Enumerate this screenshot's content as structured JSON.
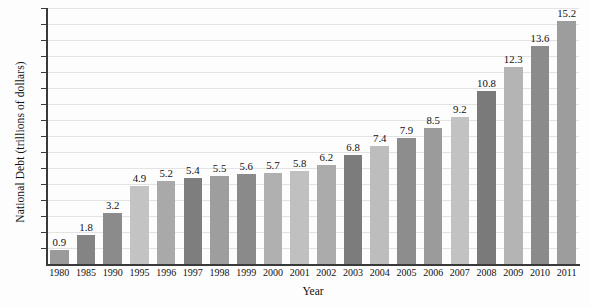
{
  "chart_data": {
    "type": "bar",
    "title": "",
    "xlabel": "Year",
    "ylabel": "National Debt (trillions of dollars)",
    "categories": [
      "1980",
      "1985",
      "1990",
      "1995",
      "1996",
      "1997",
      "1998",
      "1999",
      "2000",
      "2001",
      "2002",
      "2003",
      "2004",
      "2005",
      "2006",
      "2007",
      "2008",
      "2009",
      "2010",
      "2011"
    ],
    "values": [
      0.9,
      1.8,
      3.2,
      4.9,
      5.2,
      5.4,
      5.5,
      5.6,
      5.7,
      5.8,
      6.2,
      6.8,
      7.4,
      7.9,
      8.5,
      9.2,
      10.8,
      12.3,
      13.6,
      15.2
    ],
    "value_labels": [
      "0.9",
      "1.8",
      "3.2",
      "4.9",
      "5.2",
      "5.4",
      "5.5",
      "5.6",
      "5.7",
      "5.8",
      "6.2",
      "6.8",
      "7.4",
      "7.9",
      "8.5",
      "9.2",
      "10.8",
      "12.3",
      "13.6",
      "15.2"
    ],
    "bar_colors": [
      "#9a9a9a",
      "#848484",
      "#8b8b8b",
      "#c3c3c3",
      "#a9a9a9",
      "#7e7e7e",
      "#9e9e9e",
      "#8a8a8a",
      "#b0b0b0",
      "#c0c0c0",
      "#ababab",
      "#7c7c7c",
      "#bdbdbd",
      "#8d8d8d",
      "#9b9b9b",
      "#c2c2c2",
      "#7a7a7a",
      "#b4b4b4",
      "#8b8b8b",
      "#9d9d9d"
    ],
    "ylim": [
      0,
      16
    ],
    "yticks": [
      1,
      2,
      3,
      4,
      5,
      6,
      7,
      8,
      9,
      10,
      11,
      12,
      13,
      14,
      15,
      16
    ],
    "ytick_labels": [
      "1",
      "2",
      "3",
      "4",
      "5",
      "6",
      "7",
      "8",
      "9",
      "10",
      "11",
      "12",
      "13",
      "14",
      "15",
      "16"
    ],
    "grid": true,
    "grid_color": "#e3e3e3",
    "axis_color": "#3a3a3a",
    "legend": "none",
    "background": "#fdfdfd"
  }
}
